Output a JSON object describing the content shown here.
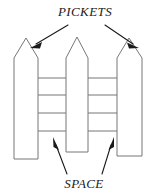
{
  "figure": {
    "name": "picket-fence-diagram",
    "type": "diagram",
    "background_color": "#ffffff",
    "stroke_color": "#777777",
    "label_color": "#1a1a1a",
    "width": 164,
    "height": 196
  },
  "labels": {
    "top": {
      "text": "PICKETS",
      "x": 85,
      "y": 16,
      "points_to": [
        "left-picket",
        "right-picket"
      ]
    },
    "bottom": {
      "text": "SPACE",
      "x": 84,
      "y": 188,
      "points_to": [
        "left-gap",
        "right-gap"
      ]
    }
  },
  "pickets": [
    {
      "name": "left-picket",
      "left": 14,
      "right": 38,
      "shoulder_y": 58,
      "apex_x": 26,
      "apex_y": 38,
      "bottom_y": 159
    },
    {
      "name": "middle-picket",
      "left": 66,
      "right": 88,
      "shoulder_y": 58,
      "apex_x": 77,
      "apex_y": 37,
      "bottom_y": 152
    },
    {
      "name": "right-picket",
      "left": 117,
      "right": 142,
      "shoulder_y": 58,
      "apex_x": 129,
      "apex_y": 38,
      "bottom_y": 156
    }
  ],
  "rails": [
    {
      "name": "rail-1",
      "y": 78
    },
    {
      "name": "rail-2",
      "y": 95
    },
    {
      "name": "rail-3",
      "y": 113
    },
    {
      "name": "rail-4",
      "y": 131
    }
  ],
  "gaps": [
    {
      "name": "left-gap",
      "left": 38,
      "right": 66
    },
    {
      "name": "right-gap",
      "left": 88,
      "right": 117
    }
  ],
  "arrows": [
    {
      "name": "arrow-to-left-picket",
      "from_x": 68,
      "from_y": 25,
      "to_x": 33,
      "to_y": 46,
      "direction": "down-left"
    },
    {
      "name": "arrow-to-right-picket",
      "from_x": 105,
      "from_y": 25,
      "to_x": 135,
      "to_y": 46,
      "direction": "down-right"
    },
    {
      "name": "arrow-to-left-gap",
      "from_x": 66,
      "from_y": 175,
      "to_x": 54,
      "to_y": 140,
      "direction": "up-left"
    },
    {
      "name": "arrow-to-right-gap",
      "from_x": 103,
      "from_y": 175,
      "to_x": 113,
      "to_y": 140,
      "direction": "up-right"
    }
  ]
}
